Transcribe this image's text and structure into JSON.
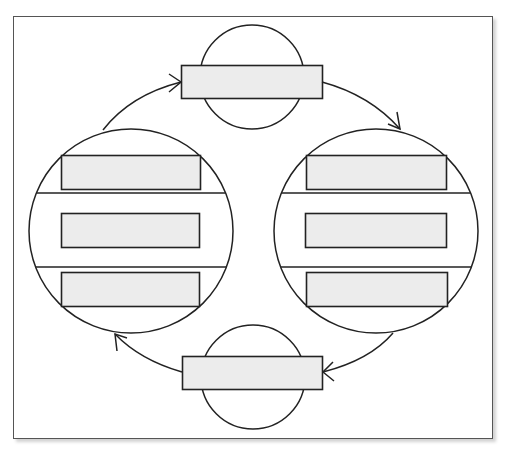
{
  "diagram": {
    "type": "cycle",
    "colors": {
      "stroke": "#222222",
      "box_fill": "#ececec",
      "background": "#ffffff",
      "frame_border": "#555555"
    },
    "nodes": {
      "top": {
        "label": "",
        "shape": "small-circle",
        "boxes": [
          ""
        ]
      },
      "right": {
        "label": "",
        "shape": "large-circle",
        "boxes": [
          "",
          "",
          ""
        ]
      },
      "bottom": {
        "label": "",
        "shape": "small-circle",
        "boxes": [
          ""
        ]
      },
      "left": {
        "label": "",
        "shape": "large-circle",
        "boxes": [
          "",
          "",
          ""
        ]
      }
    },
    "edges": [
      {
        "from": "left",
        "to": "top"
      },
      {
        "from": "top",
        "to": "right"
      },
      {
        "from": "right",
        "to": "bottom"
      },
      {
        "from": "bottom",
        "to": "left"
      }
    ]
  }
}
